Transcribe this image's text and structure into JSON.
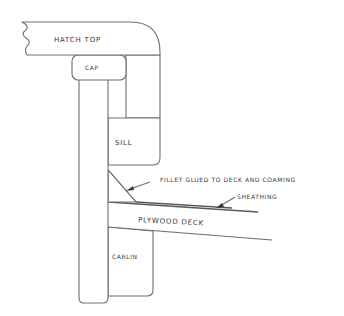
{
  "diagram": {
    "type": "cross-section",
    "labels": {
      "hatch_top": "HATCH TOP",
      "cap": "CAP",
      "sill": "SILL",
      "fillet": "FILLET GLUED TO DECK AND COAMING",
      "sheathing": "SHEATHING",
      "plywood_deck": "PLYWOOD DECK",
      "carlin": "CARLIN"
    },
    "colors": {
      "line": "#6e6e6e",
      "text": "#3a3a3a",
      "background": "#ffffff"
    }
  }
}
